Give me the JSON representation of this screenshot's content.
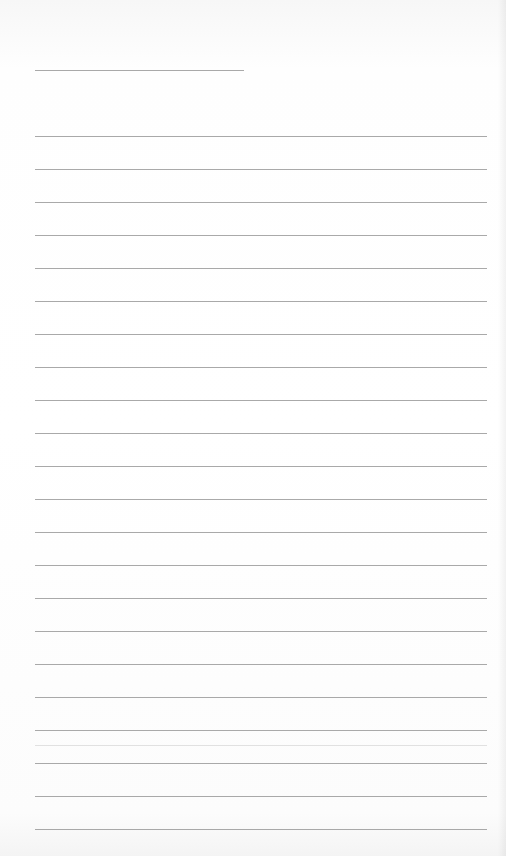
{
  "document": {
    "type": "lined-paper",
    "background_color": "#ffffff",
    "rule_color": "#9a9a9a",
    "header_rule": {
      "x": 35,
      "y": 70,
      "width": 209
    },
    "body_rules": {
      "x": 35,
      "width": 452,
      "start_y": 136,
      "spacing": 33,
      "count": 22
    },
    "faint_rule": {
      "x": 35,
      "y": 745,
      "width": 452
    },
    "text_content": []
  }
}
